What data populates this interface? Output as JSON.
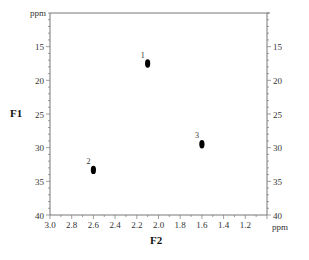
{
  "chart_data": {
    "type": "scatter",
    "title": "",
    "xlabel": "F2",
    "ylabel": "F1",
    "x_unit": "ppm",
    "y_unit": "ppm",
    "xlim": [
      3.0,
      1.0
    ],
    "ylim": [
      10,
      40
    ],
    "x_reversed": true,
    "y_reversed": true,
    "grid": false,
    "legend": null,
    "x_ticks": [
      3.0,
      2.8,
      2.6,
      2.4,
      2.2,
      2.0,
      1.8,
      1.6,
      1.4,
      1.2
    ],
    "x_tick_labels": [
      "3.0",
      "2.8",
      "2.6",
      "2.4",
      "2.2",
      "2.0",
      "1.8",
      "1.6",
      "1.4",
      "1.2"
    ],
    "y_ticks": [
      15,
      20,
      25,
      30,
      35,
      40
    ],
    "y_tick_labels": [
      "15",
      "20",
      "25",
      "30",
      "35",
      "40"
    ],
    "points": [
      {
        "label": "1",
        "x": 2.1,
        "y": 17.5
      },
      {
        "label": "2",
        "x": 2.6,
        "y": 33.3
      },
      {
        "label": "3",
        "x": 1.6,
        "y": 29.5
      }
    ]
  },
  "labels": {
    "y_unit_label": "ppm",
    "x_unit_label": "ppm",
    "f1": "F1",
    "f2": "F2"
  }
}
